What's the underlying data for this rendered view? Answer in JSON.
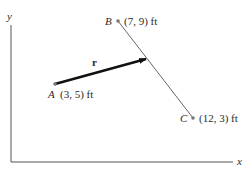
{
  "diagram": {
    "axes": {
      "x_label": "x",
      "y_label": "y"
    },
    "points": {
      "A": {
        "name": "A",
        "coords": "(3, 5) ft"
      },
      "B": {
        "name": "B",
        "coords": "(7, 9) ft"
      },
      "C": {
        "name": "C",
        "coords": "(12, 3) ft"
      }
    },
    "vector": {
      "label": "r",
      "from": "A",
      "to": "line BC"
    },
    "colors": {
      "line": "#555555",
      "vector": "#111111",
      "text": "#2a2a2a"
    }
  }
}
